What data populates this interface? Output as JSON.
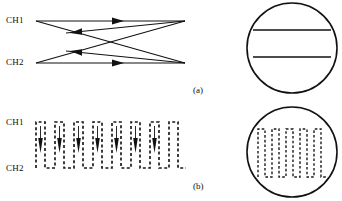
{
  "figure": {
    "panels": [
      {
        "id": "a",
        "caption": "(a)",
        "caption_x": 193,
        "caption_y": 86,
        "type": "crosstalk-arrow-diagram",
        "channels": [
          {
            "label": "CH1",
            "x": 6,
            "y": 16
          },
          {
            "label": "CH2",
            "x": 6,
            "y": 58
          }
        ],
        "paths": [
          {
            "name": "ch1-direct",
            "from": [
              36,
              21
            ],
            "to": [
              185,
              21
            ],
            "arrow": "right",
            "arrow_at": [
              118,
              21
            ]
          },
          {
            "name": "ch2-direct",
            "from": [
              36,
              63
            ],
            "to": [
              185,
              63
            ],
            "arrow": "right",
            "arrow_at": [
              118,
              63
            ]
          },
          {
            "name": "ch1-to-ch2-crosstalk",
            "from": [
              36,
              21
            ],
            "to": [
              185,
              63
            ],
            "arrow": "none"
          },
          {
            "name": "ch2-to-ch1-crosstalk",
            "from": [
              36,
              63
            ],
            "to": [
              185,
              21
            ],
            "arrow": "none"
          },
          {
            "name": "crosstalk-return-upper",
            "from": [
              185,
              21
            ],
            "to": [
              70,
              33
            ],
            "arrow": "left",
            "arrow_at": [
              78,
              32
            ]
          },
          {
            "name": "crosstalk-return-lower",
            "from": [
              185,
              63
            ],
            "to": [
              70,
              51
            ],
            "arrow": "left",
            "arrow_at": [
              78,
              52
            ]
          }
        ]
      },
      {
        "id": "b",
        "caption": "(b)",
        "caption_x": 193,
        "caption_y": 182,
        "type": "dashed-square-wave-with-drop-arrows",
        "channels": [
          {
            "label": "CH1",
            "x": 6,
            "y": 118
          },
          {
            "label": "CH2",
            "x": 6,
            "y": 164
          }
        ],
        "wave": {
          "x_start": 36,
          "x_end": 186,
          "y_high": 122,
          "y_low": 168,
          "cycles": 8,
          "duty": 0.5,
          "dash_pattern": "3 2.4",
          "stroke_color": "#1a1a1a"
        },
        "drop_arrows": {
          "count": 7,
          "direction": "down",
          "y_top": 126,
          "y_tip": 152,
          "color": "#111111"
        }
      }
    ],
    "scopes": [
      {
        "id": "scope-top",
        "type": "oscilloscope-display",
        "center": [
          292,
          48
        ],
        "radius": 45,
        "traces": [
          {
            "name": "trace-upper-flat",
            "y": 30,
            "x1": 254,
            "x2": 332
          },
          {
            "name": "trace-lower-flat",
            "y": 57,
            "x1": 254,
            "x2": 332
          }
        ]
      },
      {
        "id": "scope-bottom",
        "type": "oscilloscope-display",
        "center": [
          292,
          152
        ],
        "radius": 45,
        "traces": [
          {
            "name": "trace-square-wave",
            "x_start": 258,
            "x_end": 328,
            "y_high": 129,
            "y_low": 177,
            "cycles": 5,
            "dashed": true
          }
        ]
      }
    ],
    "colors": {
      "ink": "#111111",
      "background": "#ffffff"
    }
  }
}
